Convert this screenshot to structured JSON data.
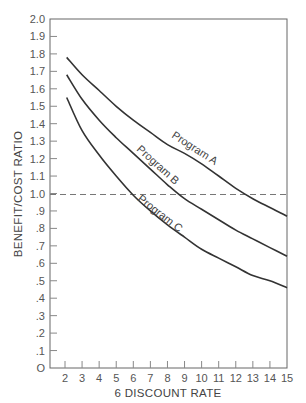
{
  "chart_data": {
    "type": "line",
    "title": "",
    "xlabel": "6 DISCOUNT RATE",
    "ylabel": "BENEFIT/COST RATIO",
    "xlim": [
      1.1,
      15
    ],
    "ylim": [
      0,
      2.0
    ],
    "grid": false,
    "legend": "inline curve labels",
    "x_ticks": [
      "2",
      "3",
      "4",
      "5",
      "6",
      "7",
      "8",
      "9",
      "10",
      "11",
      "12",
      "13",
      "14",
      "15"
    ],
    "y_ticks": [
      "O",
      ".1",
      ".2",
      ".3",
      ".4",
      ".5",
      ".6",
      ".7",
      ".8",
      ".9",
      "1.0",
      "1.1",
      "1.2",
      "1.3",
      "1.4",
      "1.5",
      "1.6",
      "1.7",
      "1.8",
      "1.9",
      "2.0"
    ],
    "reference_line": {
      "y": 1.0,
      "style": "dashed"
    },
    "x": [
      2.1,
      3,
      4,
      5,
      6,
      7,
      8,
      9,
      10,
      11,
      12,
      13,
      14,
      15
    ],
    "series": [
      {
        "name": "Program A",
        "values": [
          1.78,
          1.68,
          1.59,
          1.5,
          1.42,
          1.35,
          1.28,
          1.23,
          1.17,
          1.1,
          1.03,
          0.97,
          0.92,
          0.87
        ]
      },
      {
        "name": "Program B",
        "values": [
          1.68,
          1.54,
          1.42,
          1.32,
          1.23,
          1.14,
          1.05,
          0.97,
          0.91,
          0.85,
          0.79,
          0.74,
          0.69,
          0.64
        ]
      },
      {
        "name": "Program C",
        "values": [
          1.55,
          1.36,
          1.22,
          1.1,
          0.99,
          0.9,
          0.82,
          0.75,
          0.68,
          0.63,
          0.58,
          0.53,
          0.5,
          0.46
        ]
      }
    ]
  },
  "labels": {
    "program_a": "Program  A",
    "program_b": "Program  B",
    "program_c": "Program  C",
    "xlabel": "6 DISCOUNT RATE",
    "ylabel": "BENEFIT/COST RATIO"
  }
}
